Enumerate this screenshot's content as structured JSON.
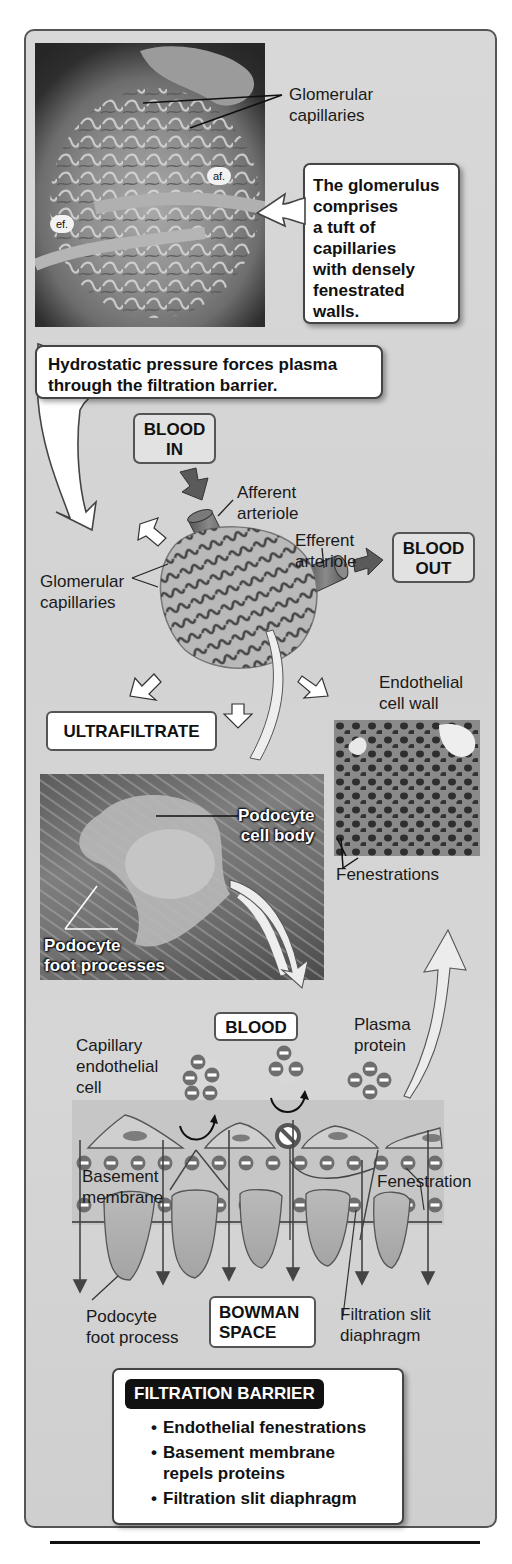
{
  "figure": {
    "top_micrograph": {
      "label_glomerular_capillaries": "Glomerular capillaries",
      "label_glomerular_line1": "Glomerular",
      "label_glomerular_line2": "capillaries",
      "tag_af": "af.",
      "tag_ef": "ef.",
      "callout_lines": [
        "The glomerulus",
        "comprises",
        "a tuft of",
        "capillaries",
        "with densely",
        "fenestrated",
        "walls."
      ]
    },
    "pressure_callout": {
      "line1": "Hydrostatic pressure forces plasma",
      "line2": "through the filtration barrier."
    },
    "glomerulus_diagram": {
      "blood_in_line1": "BLOOD",
      "blood_in_line2": "IN",
      "afferent_line1": "Afferent",
      "afferent_line2": "arteriole",
      "efferent_line1": "Efferent",
      "efferent_line2": "arteriole",
      "blood_out_line1": "BLOOD",
      "blood_out_line2": "OUT",
      "capillaries_line1": "Glomerular",
      "capillaries_line2": "capillaries",
      "ultrafiltrate": "ULTRAFILTRATE"
    },
    "endothelial_micrograph": {
      "title_line1": "Endothelial",
      "title_line2": "cell wall",
      "fenestrations": "Fenestrations"
    },
    "podocyte_micrograph": {
      "cell_body_line1": "Podocyte",
      "cell_body_line2": "cell body",
      "foot_line1": "Podocyte",
      "foot_line2": "foot processes"
    },
    "barrier_diagram": {
      "blood": "BLOOD",
      "capillary_line1": "Capillary",
      "capillary_line2": "endothelial",
      "capillary_line3": "cell",
      "plasma_line1": "Plasma",
      "plasma_line2": "protein",
      "basement_line1": "Basement",
      "basement_line2": "membrane",
      "fenestration": "Fenestration",
      "podocyte_line1": "Podocyte",
      "podocyte_line2": "foot process",
      "bowman_line1": "BOWMAN",
      "bowman_line2": "SPACE",
      "slit_line1": "Filtration slit",
      "slit_line2": "diaphragm",
      "charge_symbol": "−"
    },
    "filtration_barrier_box": {
      "title": "FILTRATION BARRIER",
      "items": [
        "Endothelial fenestrations",
        "Basement membrane repels proteins",
        "Filtration slit diaphragm"
      ],
      "item2_line1": "Basement membrane",
      "item2_line2": "repels proteins"
    }
  },
  "colors": {
    "panel_bg": "#d6d6d6",
    "panel_border": "#555555",
    "arrow_dark": "#555555",
    "membrane_fill": "#bdbdbd",
    "charge_circle": "#6e6e6e"
  }
}
